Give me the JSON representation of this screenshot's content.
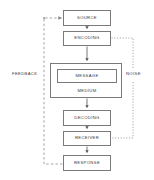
{
  "diagram": {
    "nodes": {
      "source": "SOURCE",
      "encoding": "ENCODING",
      "message": "MESSAGE",
      "medium": "MEDIUM",
      "decoding": "DECODING",
      "receiver": "RECEIVER",
      "response": "RESPONSE"
    },
    "annotations": {
      "feedback": "FEEDBACK",
      "noise": "NOISE"
    },
    "colors": {
      "box_border": "#7a7a7a",
      "text": "#3a3a3a",
      "flow_line": "#55555 5",
      "feedback_line": "#8a8a8a",
      "noise_line": "#8a8a8a",
      "background": "#ffffff"
    },
    "flows": [
      {
        "from": "SOURCE",
        "to": "ENCODING",
        "style": "solid-arrow"
      },
      {
        "from": "ENCODING",
        "to": "MEDIUM",
        "style": "solid-arrow"
      },
      {
        "from": "MEDIUM",
        "to": "DECODING",
        "style": "solid-arrow"
      },
      {
        "from": "DECODING",
        "to": "RECEIVER",
        "style": "solid-arrow"
      },
      {
        "from": "RECEIVER",
        "to": "RESPONSE",
        "style": "solid-arrow"
      },
      {
        "from": "RESPONSE",
        "to": "SOURCE",
        "style": "dashed-arrow",
        "label": "FEEDBACK"
      },
      {
        "from": "NOISE",
        "to": "ENCODING",
        "style": "dotted"
      },
      {
        "from": "NOISE",
        "to": "RECEIVER",
        "style": "dotted"
      }
    ]
  }
}
